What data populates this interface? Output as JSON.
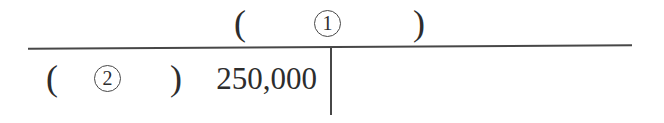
{
  "t_account": {
    "title_row": {
      "open_paren": "(",
      "circled_digit": "1",
      "close_paren": ")"
    },
    "debit_row": {
      "open_paren": "(",
      "circled_digit": "2",
      "close_paren": ")",
      "amount": "250,000"
    },
    "colors": {
      "line": "#474747",
      "text": "#2d2d2d",
      "background": "#ffffff"
    }
  }
}
